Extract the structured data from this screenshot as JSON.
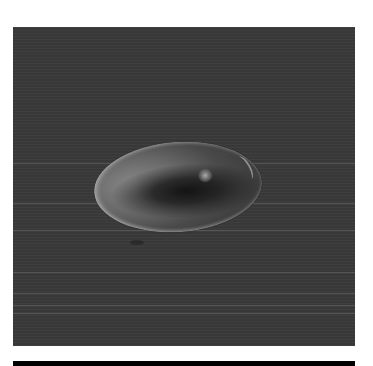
{
  "image": {
    "subject": "liquid droplet on dark flat surface",
    "colors": {
      "background": "#ffffff",
      "panel": "#3a3a3a",
      "droplet_core": "#1a1a1a",
      "droplet_edge": "#8a8a8a",
      "bottom_bar": "#000000"
    },
    "scan_lines_y": [
      163,
      203,
      230,
      272,
      293,
      305,
      313
    ]
  }
}
